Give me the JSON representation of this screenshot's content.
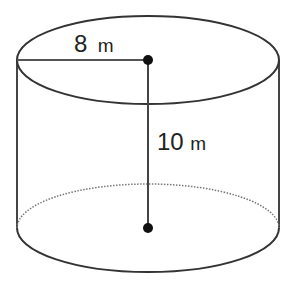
{
  "diagram": {
    "shape": "cylinder",
    "radius": {
      "value": "8",
      "unit": "m"
    },
    "height": {
      "value": "10",
      "unit": "m"
    },
    "colors": {
      "stroke": "#333333",
      "dot": "#111111",
      "background": "#ffffff"
    }
  }
}
